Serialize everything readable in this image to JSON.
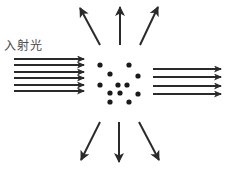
{
  "diagram": {
    "label": "入射光",
    "colors": {
      "arrow": "#2a2a2a",
      "particle": "#1a1a1a",
      "label": "#4a4a4a"
    },
    "incident_arrows": {
      "count": 6,
      "x1": 14,
      "x2": 84,
      "ys": [
        59,
        65,
        72,
        78,
        85,
        91
      ]
    },
    "transmitted_arrows": {
      "count": 4,
      "x1": 153,
      "x2": 221,
      "ys": [
        69,
        77,
        86,
        94
      ]
    },
    "scattered_arrows": [
      {
        "dir": "up-left",
        "x1": 100,
        "y1": 45,
        "x2": 80,
        "y2": 8
      },
      {
        "dir": "up",
        "x1": 120,
        "y1": 45,
        "x2": 120,
        "y2": 7
      },
      {
        "dir": "up-right",
        "x1": 140,
        "y1": 45,
        "x2": 158,
        "y2": 7
      },
      {
        "dir": "down-left",
        "x1": 100,
        "y1": 122,
        "x2": 81,
        "y2": 160
      },
      {
        "dir": "down",
        "x1": 119,
        "y1": 122,
        "x2": 119,
        "y2": 162
      },
      {
        "dir": "down-right",
        "x1": 139,
        "y1": 122,
        "x2": 159,
        "y2": 160
      }
    ],
    "particles": [
      [
        100,
        65
      ],
      [
        129,
        65
      ],
      [
        110,
        74
      ],
      [
        138,
        76
      ],
      [
        100,
        85
      ],
      [
        118,
        85
      ],
      [
        127,
        85
      ],
      [
        110,
        93
      ],
      [
        120,
        93
      ],
      [
        138,
        94
      ],
      [
        110,
        102
      ],
      [
        129,
        102
      ]
    ]
  }
}
